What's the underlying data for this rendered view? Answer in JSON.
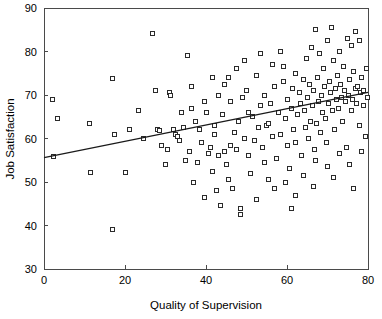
{
  "chart_data": {
    "type": "scatter",
    "title": "",
    "xlabel": "Quality of Supervision",
    "ylabel": "Job Satisfaction",
    "xlim": [
      0,
      80
    ],
    "ylim": [
      30,
      90
    ],
    "xticks": [
      0,
      20,
      40,
      60,
      80
    ],
    "yticks": [
      30,
      40,
      50,
      60,
      70,
      80,
      90
    ],
    "xtick_labels": [
      "0",
      "20",
      "40",
      "60",
      "80"
    ],
    "ytick_labels": [
      "30",
      "40",
      "50",
      "60",
      "70",
      "80",
      "90"
    ],
    "grid": false,
    "legend": null,
    "marker": "open-square",
    "trendline": {
      "type": "linear",
      "x0": 0,
      "y0": 55.6,
      "x1": 80,
      "y1": 70.6,
      "slope": 0.1875,
      "intercept": 55.6
    },
    "points": [
      [
        2.0,
        69.0
      ],
      [
        2.3,
        55.8
      ],
      [
        3.2,
        64.5
      ],
      [
        11.2,
        63.5
      ],
      [
        11.5,
        52.2
      ],
      [
        16.8,
        39.0
      ],
      [
        17.0,
        73.8
      ],
      [
        17.5,
        61.0
      ],
      [
        20.0,
        52.3
      ],
      [
        23.2,
        66.5
      ],
      [
        26.8,
        84.2
      ],
      [
        27.6,
        71.0
      ],
      [
        28.0,
        62.0
      ],
      [
        28.5,
        61.8
      ],
      [
        29.0,
        58.5
      ],
      [
        30.5,
        57.5
      ],
      [
        31.0,
        70.5
      ],
      [
        31.2,
        70.0
      ],
      [
        32.0,
        62.0
      ],
      [
        32.5,
        61.0
      ],
      [
        33.0,
        60.5
      ],
      [
        33.5,
        59.5
      ],
      [
        34.5,
        62.5
      ],
      [
        35.0,
        55.0
      ],
      [
        35.5,
        79.0
      ],
      [
        36.0,
        57.0
      ],
      [
        36.5,
        67.0
      ],
      [
        37.0,
        50.0
      ],
      [
        37.5,
        64.0
      ],
      [
        38.0,
        54.5
      ],
      [
        38.5,
        62.0
      ],
      [
        39.0,
        59.0
      ],
      [
        39.5,
        46.5
      ],
      [
        40.0,
        66.0
      ],
      [
        40.5,
        56.5
      ],
      [
        41.0,
        58.0
      ],
      [
        41.5,
        52.5
      ],
      [
        42.0,
        61.0
      ],
      [
        42.2,
        63.0
      ],
      [
        42.5,
        48.0
      ],
      [
        43.0,
        56.0
      ],
      [
        43.5,
        44.5
      ],
      [
        44.0,
        65.5
      ],
      [
        44.5,
        57.0
      ],
      [
        45.0,
        54.0
      ],
      [
        45.5,
        50.5
      ],
      [
        46.0,
        68.5
      ],
      [
        46.5,
        48.5
      ],
      [
        47.0,
        61.5
      ],
      [
        47.5,
        57.5
      ],
      [
        48.0,
        64.0
      ],
      [
        48.5,
        44.0
      ],
      [
        49.0,
        69.5
      ],
      [
        49.5,
        60.0
      ],
      [
        50.0,
        71.0
      ],
      [
        50.5,
        56.0
      ],
      [
        51.0,
        52.0
      ],
      [
        51.5,
        65.0
      ],
      [
        52.0,
        59.5
      ],
      [
        52.5,
        74.5
      ],
      [
        53.0,
        62.5
      ],
      [
        53.5,
        67.5
      ],
      [
        54.0,
        58.0
      ],
      [
        54.5,
        70.0
      ],
      [
        55.0,
        63.0
      ],
      [
        55.3,
        63.5
      ],
      [
        55.5,
        50.5
      ],
      [
        56.0,
        68.0
      ],
      [
        56.5,
        60.5
      ],
      [
        57.0,
        72.0
      ],
      [
        57.5,
        55.5
      ],
      [
        58.0,
        66.0
      ],
      [
        58.5,
        61.0
      ],
      [
        59.0,
        76.5
      ],
      [
        59.2,
        73.0
      ],
      [
        59.5,
        64.5
      ],
      [
        60.0,
        58.5
      ],
      [
        60.2,
        69.0
      ],
      [
        60.5,
        53.0
      ],
      [
        61.0,
        67.0
      ],
      [
        61.3,
        71.5
      ],
      [
        61.5,
        62.0
      ],
      [
        62.0,
        75.0
      ],
      [
        62.2,
        59.0
      ],
      [
        62.5,
        65.5
      ],
      [
        63.0,
        70.5
      ],
      [
        63.2,
        68.0
      ],
      [
        63.5,
        56.0
      ],
      [
        64.0,
        73.5
      ],
      [
        64.2,
        66.5
      ],
      [
        64.5,
        62.5
      ],
      [
        64.8,
        78.5
      ],
      [
        65.0,
        69.5
      ],
      [
        65.2,
        60.0
      ],
      [
        65.5,
        72.5
      ],
      [
        65.8,
        64.0
      ],
      [
        66.0,
        81.0
      ],
      [
        66.2,
        67.5
      ],
      [
        66.5,
        71.0
      ],
      [
        66.8,
        57.5
      ],
      [
        67.0,
        85.0
      ],
      [
        67.2,
        63.5
      ],
      [
        67.5,
        74.0
      ],
      [
        67.8,
        68.5
      ],
      [
        68.0,
        79.5
      ],
      [
        68.2,
        61.5
      ],
      [
        68.5,
        70.0
      ],
      [
        68.8,
        66.0
      ],
      [
        69.0,
        76.0
      ],
      [
        69.2,
        72.0
      ],
      [
        69.5,
        64.5
      ],
      [
        69.8,
        59.0
      ],
      [
        70.0,
        82.5
      ],
      [
        70.2,
        68.0
      ],
      [
        70.5,
        73.0
      ],
      [
        70.8,
        70.5
      ],
      [
        71.0,
        85.5
      ],
      [
        71.2,
        66.5
      ],
      [
        71.5,
        78.0
      ],
      [
        71.8,
        62.0
      ],
      [
        72.0,
        71.5
      ],
      [
        72.2,
        69.0
      ],
      [
        72.5,
        74.5
      ],
      [
        72.8,
        67.0
      ],
      [
        73.0,
        80.0
      ],
      [
        73.2,
        72.5
      ],
      [
        73.5,
        69.5
      ],
      [
        73.8,
        64.0
      ],
      [
        74.0,
        76.5
      ],
      [
        74.2,
        71.0
      ],
      [
        74.5,
        68.5
      ],
      [
        74.8,
        58.0
      ],
      [
        75.0,
        83.0
      ],
      [
        75.2,
        70.0
      ],
      [
        75.5,
        73.5
      ],
      [
        75.8,
        66.5
      ],
      [
        76.0,
        81.5
      ],
      [
        76.2,
        69.0
      ],
      [
        76.5,
        75.5
      ],
      [
        76.8,
        71.5
      ],
      [
        77.0,
        84.5
      ],
      [
        77.2,
        68.0
      ],
      [
        77.5,
        72.0
      ],
      [
        77.8,
        63.0
      ],
      [
        78.0,
        82.5
      ],
      [
        78.2,
        70.5
      ],
      [
        78.5,
        74.0
      ],
      [
        78.8,
        67.5
      ],
      [
        79.0,
        71.0
      ],
      [
        79.3,
        60.5
      ],
      [
        79.5,
        76.0
      ],
      [
        79.8,
        69.5
      ],
      [
        44.5,
        72.5
      ],
      [
        45.5,
        74.0
      ],
      [
        47.5,
        76.0
      ],
      [
        49.5,
        78.0
      ],
      [
        53.5,
        79.5
      ],
      [
        56.5,
        77.0
      ],
      [
        58.5,
        80.0
      ],
      [
        34.0,
        66.0
      ],
      [
        30.0,
        54.0
      ],
      [
        24.5,
        60.0
      ],
      [
        21.0,
        62.0
      ],
      [
        43.0,
        70.0
      ],
      [
        46.0,
        58.5
      ],
      [
        50.5,
        66.0
      ],
      [
        54.5,
        54.5
      ],
      [
        57.0,
        48.5
      ],
      [
        59.5,
        50.0
      ],
      [
        62.0,
        47.0
      ],
      [
        64.0,
        51.5
      ],
      [
        67.0,
        55.0
      ],
      [
        70.0,
        53.5
      ],
      [
        73.0,
        56.5
      ],
      [
        75.5,
        54.0
      ],
      [
        78.5,
        57.0
      ],
      [
        36.5,
        72.0
      ],
      [
        39.5,
        68.5
      ],
      [
        41.5,
        74.0
      ],
      [
        52.5,
        46.0
      ],
      [
        48.5,
        42.5
      ],
      [
        61.0,
        44.0
      ],
      [
        66.5,
        49.0
      ],
      [
        71.5,
        51.0
      ],
      [
        76.5,
        48.5
      ]
    ],
    "n_points": 196
  }
}
